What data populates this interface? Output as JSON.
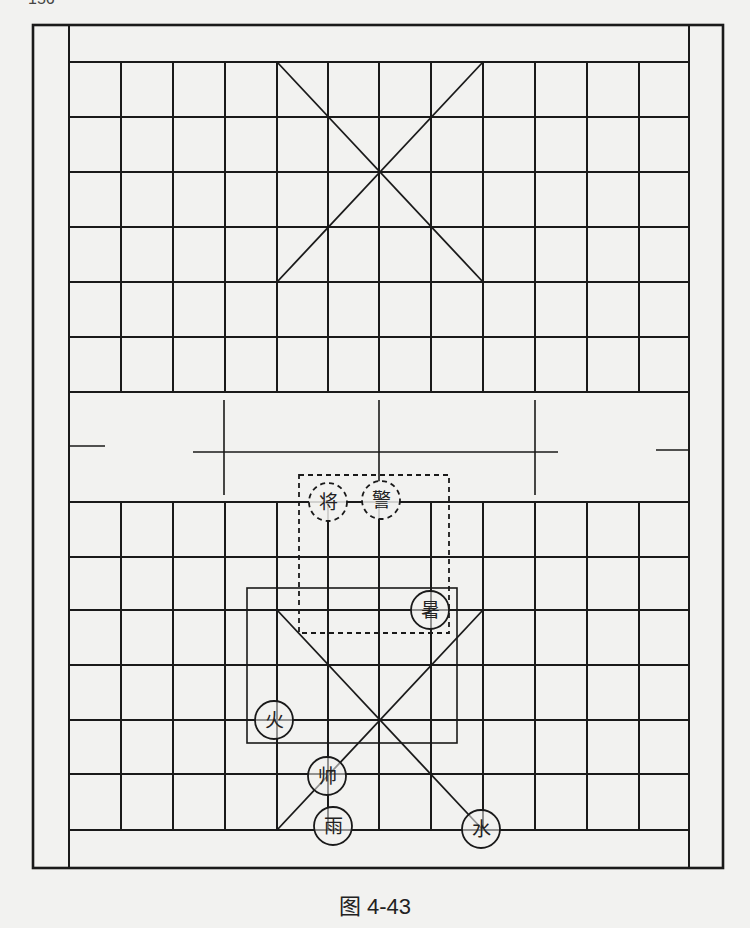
{
  "page_number": "156",
  "caption": "图 4-43",
  "board": {
    "outer": {
      "x1": 33,
      "y1": 25,
      "x2": 723,
      "y2": 868
    },
    "inner_left_x": 69,
    "inner_right_x": 689,
    "columns_x": [
      69,
      121,
      173,
      225,
      277,
      328,
      379,
      431,
      483,
      535,
      587,
      639,
      689
    ],
    "top_rows_y": [
      62,
      117,
      172,
      227,
      282,
      337,
      392
    ],
    "bottom_rows_y": [
      502,
      557,
      610,
      665,
      720,
      774,
      830
    ],
    "river": {
      "left_tick": {
        "x1": 69,
        "x2": 105,
        "y": 446
      },
      "right_tick": {
        "x1": 656,
        "x2": 689,
        "y": 450
      },
      "mid_line": {
        "x1": 193,
        "x2": 558,
        "y": 452
      },
      "verticals": [
        {
          "x": 224,
          "y1": 400,
          "y2": 495
        },
        {
          "x": 379,
          "y1": 400,
          "y2": 482
        },
        {
          "x": 535,
          "y1": 400,
          "y2": 495
        }
      ]
    },
    "top_palace": {
      "x1": 277,
      "y1": 62,
      "x2": 483,
      "y2": 282
    },
    "bottom_palace": {
      "x1": 277,
      "y1": 610,
      "x2": 483,
      "y2": 830
    },
    "dashed_box": {
      "x1": 299,
      "y1": 475,
      "x2": 449,
      "y2": 633
    },
    "solid_box": {
      "x1": 247,
      "y1": 588,
      "x2": 457,
      "y2": 743
    }
  },
  "pieces": [
    {
      "label": "将",
      "x": 328,
      "y": 502,
      "style": "dashed"
    },
    {
      "label": "警",
      "x": 381,
      "y": 500,
      "style": "dashed"
    },
    {
      "label": "暑",
      "x": 430,
      "y": 610,
      "style": "solid"
    },
    {
      "label": "火",
      "x": 274,
      "y": 720,
      "style": "solid"
    },
    {
      "label": "帅",
      "x": 327,
      "y": 776,
      "style": "solid"
    },
    {
      "label": "雨",
      "x": 333,
      "y": 826,
      "style": "solid"
    },
    {
      "label": "水",
      "x": 481,
      "y": 829,
      "style": "solid"
    }
  ],
  "colors": {
    "line": "#1a1a1a",
    "background": "#f2f2f0"
  }
}
